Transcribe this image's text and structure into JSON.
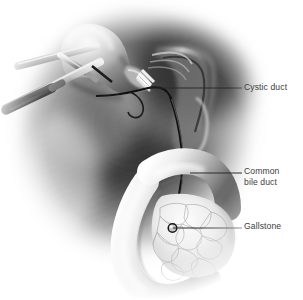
{
  "figure": {
    "kind": "medical-illustration",
    "background_color": "#ffffff",
    "label_color": "#3d3d3d",
    "leader_color": "#2a2a2a",
    "palette": {
      "tissue_light": "#f2f2f2",
      "tissue_mid": "#9a9a9a",
      "tissue_dark": "#3a3a3a",
      "tissue_deep": "#1e1e1e",
      "instrument_steel": "#b9b9b9",
      "instrument_black": "#131313",
      "clip_highlight": "#fafafa",
      "duct_line": "#141414"
    }
  },
  "labels": [
    {
      "id": "cystic-duct",
      "text": "Cystic duct",
      "leader": {
        "x1": 150,
        "y1": 88,
        "x2": 242,
        "y2": 88
      },
      "target_point": {
        "x": 150,
        "y": 88
      }
    },
    {
      "id": "common-bile-duct",
      "line1": "Common",
      "line2": "bile duct",
      "text": "Common bile duct",
      "leader": {
        "x1": 190,
        "y1": 173,
        "x2": 242,
        "y2": 173
      },
      "target_point": {
        "x": 190,
        "y": 173
      }
    },
    {
      "id": "gallstone",
      "text": "Gallstone",
      "leader": {
        "x1": 173,
        "y1": 228,
        "x2": 242,
        "y2": 228
      },
      "target_point": {
        "x": 173,
        "y": 228
      }
    }
  ],
  "structures": [
    {
      "id": "gallbladder",
      "name": "Gallbladder"
    },
    {
      "id": "cystic-duct",
      "name": "Cystic duct"
    },
    {
      "id": "common-bile-duct",
      "name": "Common bile duct"
    },
    {
      "id": "duodenum",
      "name": "Duodenum"
    },
    {
      "id": "pancreas",
      "name": "Pancreas"
    },
    {
      "id": "liver-bed",
      "name": "Liver bed / omentum"
    },
    {
      "id": "hepatoduodenal-ligament",
      "name": "Hepatoduodenal ligament"
    },
    {
      "id": "gallstone",
      "name": "Gallstone"
    },
    {
      "id": "surgical-clip",
      "name": "Surgical clip"
    },
    {
      "id": "grasper-upper",
      "name": "Laparoscopic grasper"
    },
    {
      "id": "grasper-lower",
      "name": "Laparoscopic trocar instrument"
    }
  ]
}
